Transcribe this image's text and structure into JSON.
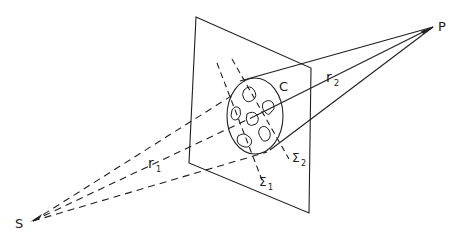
{
  "figure": {
    "type": "diffraction geometry diagram",
    "labels": {
      "source": "S",
      "point": "P",
      "aperture": "C",
      "r1": "r",
      "r1_sub": "1",
      "r2": "r",
      "r2_sub": "2",
      "sigma1": "Σ",
      "sigma1_sub": "1",
      "sigma2": "Σ",
      "sigma2_sub": "2"
    },
    "colors": {
      "line": "#1f1f1f",
      "background": "#ffffff"
    }
  }
}
